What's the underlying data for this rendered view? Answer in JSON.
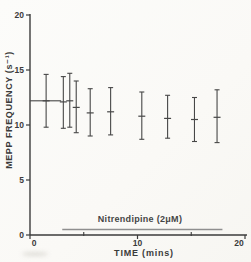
{
  "colors": {
    "ink": "#3b3b3b",
    "error_bar": "#474747",
    "treatment_bar": "#8f8f8f",
    "background": "#fbfaf7"
  },
  "chart_data": {
    "type": "scatter",
    "xlabel": "TIME (mins)",
    "ylabel": "MEPP FREQUENCY (s⁻¹)",
    "xlim": [
      0,
      20
    ],
    "ylim": [
      0,
      20
    ],
    "grid": false,
    "legend": null,
    "y_ticks": [
      0,
      5,
      10,
      15,
      20
    ],
    "x_ticks_labeled": [
      0,
      10,
      20
    ],
    "x_ticks_minor": [
      5,
      15
    ],
    "points": [
      {
        "x": 1.5,
        "y": 12.2,
        "y_hi": 14.6,
        "y_lo": 9.8
      },
      {
        "x": 3.1,
        "y": 12.1,
        "y_hi": 14.4,
        "y_lo": 9.7
      },
      {
        "x": 3.7,
        "y": 12.2,
        "y_hi": 14.7,
        "y_lo": 9.8
      },
      {
        "x": 4.3,
        "y": 11.6,
        "y_hi": 14.0,
        "y_lo": 9.3
      },
      {
        "x": 5.6,
        "y": 11.1,
        "y_hi": 13.3,
        "y_lo": 9.0
      },
      {
        "x": 7.5,
        "y": 11.2,
        "y_hi": 13.4,
        "y_lo": 9.1
      },
      {
        "x": 10.4,
        "y": 10.8,
        "y_hi": 13.0,
        "y_lo": 8.7
      },
      {
        "x": 12.8,
        "y": 10.6,
        "y_hi": 12.7,
        "y_lo": 8.8
      },
      {
        "x": 15.3,
        "y": 10.5,
        "y_hi": 12.5,
        "y_lo": 8.5
      },
      {
        "x": 17.4,
        "y": 10.7,
        "y_hi": 13.2,
        "y_lo": 8.4
      }
    ],
    "baseline_mean_line": {
      "y": 12.2,
      "x_start": 0,
      "x_end": 2.9
    },
    "treatment_bar": {
      "label": "Nitrendipine (2μM)",
      "x_start": 3.0,
      "x_end": 17.9,
      "y": 0.5
    }
  }
}
